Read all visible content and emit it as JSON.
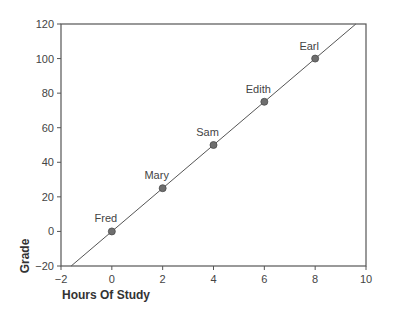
{
  "chart_data": {
    "type": "scatter",
    "title": "",
    "xlabel": "Hours Of Study",
    "ylabel": "Grade",
    "xlim": [
      -2,
      10
    ],
    "ylim": [
      -20,
      120
    ],
    "xticks": [
      -2,
      0,
      2,
      4,
      6,
      8,
      10
    ],
    "yticks": [
      -20,
      0,
      20,
      40,
      60,
      80,
      100,
      120
    ],
    "grid": false,
    "legend": null,
    "points": [
      {
        "label": "Fred",
        "x": 0,
        "y": 0
      },
      {
        "label": "Mary",
        "x": 2,
        "y": 25
      },
      {
        "label": "Sam",
        "x": 4,
        "y": 50
      },
      {
        "label": "Edith",
        "x": 6,
        "y": 75
      },
      {
        "label": "Earl",
        "x": 8,
        "y": 100
      }
    ],
    "fit_line": {
      "slope": 12.5,
      "intercept": 0,
      "description": "y = 12.5x, drawn across full plot"
    },
    "colors": {
      "point": "#6e6e6e",
      "line": "#555555",
      "axis": "#555555"
    }
  }
}
